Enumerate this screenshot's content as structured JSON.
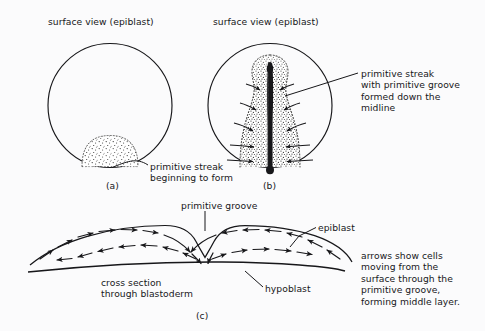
{
  "figure": {
    "background_color": "#fbfbfc",
    "ink_color": "#17171a"
  },
  "panels": {
    "a": {
      "id": "(a)",
      "header": "surface view (epiblast)",
      "callout": "primitive streak\nbeginning to form"
    },
    "b": {
      "id": "(b)",
      "header": "surface view (epiblast)",
      "callout": "primitive streak\nwith primitive groove\nformed down the\nmidline"
    },
    "c": {
      "id": "(c)",
      "label_groove": "primitive groove",
      "label_epiblast": "epiblast",
      "label_hypoblast": "hypoblast",
      "label_cross_section": "cross section\nthrough blastoderm",
      "note": "arrows show cells\nmoving from the\nsurface through the\nprimitive groove,\nforming middle layer."
    }
  }
}
